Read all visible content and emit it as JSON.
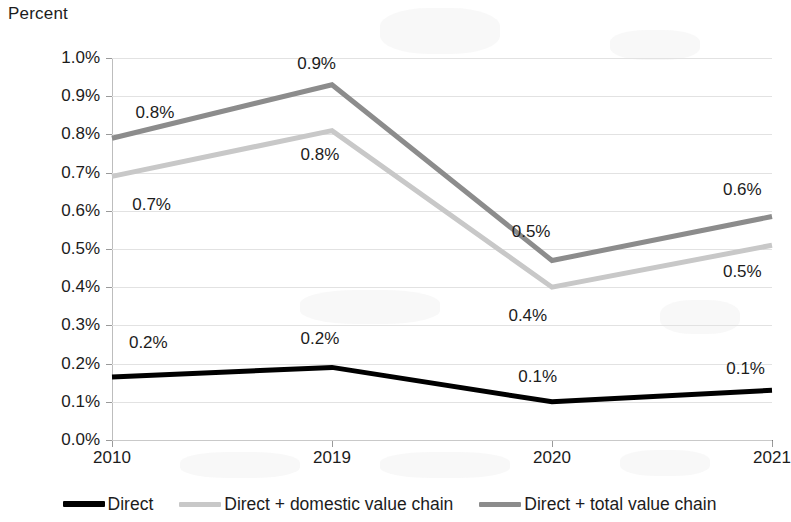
{
  "chart_data": {
    "type": "line",
    "title": "",
    "subtitle": "",
    "ylabel": "Percent",
    "xlabel": "",
    "categories": [
      "2010",
      "2019",
      "2020",
      "2021"
    ],
    "ylim": [
      0.0,
      1.0
    ],
    "ytick_step": 0.1,
    "ytick_labels": [
      "0.0%",
      "0.1%",
      "0.2%",
      "0.3%",
      "0.4%",
      "0.5%",
      "0.6%",
      "0.7%",
      "0.8%",
      "0.9%",
      "1.0%"
    ],
    "ytick_values": [
      0.0,
      0.1,
      0.2,
      0.3,
      0.4,
      0.5,
      0.6,
      0.7,
      0.8,
      0.9,
      1.0
    ],
    "grid": true,
    "legend_position": "bottom",
    "series": [
      {
        "name": "Direct",
        "color": "#000000",
        "width": 5,
        "values": [
          0.165,
          0.19,
          0.1,
          0.13
        ],
        "labels": [
          "0.2%",
          "0.2%",
          "0.1%",
          "0.1%"
        ]
      },
      {
        "name": "Direct + domestic value chain",
        "color": "#c8c8c8",
        "width": 5,
        "values": [
          0.69,
          0.81,
          0.4,
          0.51
        ],
        "labels": [
          "0.7%",
          "0.8%",
          "0.4%",
          "0.5%"
        ]
      },
      {
        "name": "Direct + total value chain",
        "color": "#8c8c8c",
        "width": 5,
        "values": [
          0.79,
          0.93,
          0.47,
          0.585
        ],
        "labels": [
          "0.8%",
          "0.9%",
          "0.5%",
          "0.6%"
        ]
      }
    ],
    "data_labels": [
      {
        "text": "0.8%",
        "x_pct": 6.5,
        "y_value": 0.855,
        "series": "Direct + total value chain",
        "point": "2010"
      },
      {
        "text": "0.9%",
        "x_pct": 31.0,
        "y_value": 0.985,
        "series": "Direct + total value chain",
        "point": "2019"
      },
      {
        "text": "0.5%",
        "x_pct": 63.5,
        "y_value": 0.545,
        "series": "Direct + total value chain",
        "point": "2020"
      },
      {
        "text": "0.6%",
        "x_pct": 95.5,
        "y_value": 0.655,
        "series": "Direct + total value chain",
        "point": "2021"
      },
      {
        "text": "0.7%",
        "x_pct": 6.0,
        "y_value": 0.615,
        "series": "Direct + domestic value chain",
        "point": "2010"
      },
      {
        "text": "0.8%",
        "x_pct": 31.5,
        "y_value": 0.745,
        "series": "Direct + domestic value chain",
        "point": "2019"
      },
      {
        "text": "0.4%",
        "x_pct": 63.0,
        "y_value": 0.325,
        "series": "Direct + domestic value chain",
        "point": "2020"
      },
      {
        "text": "0.5%",
        "x_pct": 95.5,
        "y_value": 0.44,
        "series": "Direct + domestic value chain",
        "point": "2021"
      },
      {
        "text": "0.2%",
        "x_pct": 5.5,
        "y_value": 0.255,
        "series": "Direct",
        "point": "2010"
      },
      {
        "text": "0.2%",
        "x_pct": 31.5,
        "y_value": 0.265,
        "series": "Direct",
        "point": "2019"
      },
      {
        "text": "0.1%",
        "x_pct": 64.5,
        "y_value": 0.165,
        "series": "Direct",
        "point": "2020"
      },
      {
        "text": "0.1%",
        "x_pct": 96.0,
        "y_value": 0.185,
        "series": "Direct",
        "point": "2021"
      }
    ]
  },
  "legend": {
    "items": [
      {
        "label": "Direct",
        "color": "#000000"
      },
      {
        "label": "Direct + domestic value chain",
        "color": "#c8c8c8"
      },
      {
        "label": "Direct + total value chain",
        "color": "#8c8c8c"
      }
    ]
  },
  "colors": {
    "direct": "#000000",
    "domestic_value_chain": "#c8c8c8",
    "total_value_chain": "#8c8c8c",
    "gridline": "#e2e2e2",
    "axis": "#7a7a7a",
    "text": "#1c1c1c",
    "background": "#ffffff"
  }
}
